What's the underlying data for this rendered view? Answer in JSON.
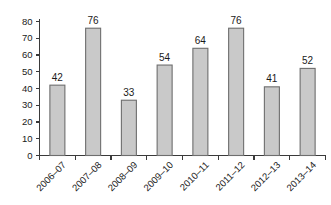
{
  "chart_data": {
    "type": "bar",
    "title": "",
    "subtitle": "",
    "xlabel": "",
    "ylabel": "",
    "categories": [
      "2006–07",
      "2007–08",
      "2008–09",
      "2009–10",
      "2010–11",
      "2011–12",
      "2012–13",
      "2013–14"
    ],
    "values": [
      42,
      76,
      33,
      54,
      64,
      76,
      41,
      52
    ],
    "data_labels": [
      "42",
      "76",
      "33",
      "54",
      "64",
      "76",
      "41",
      "52"
    ],
    "ylim": [
      0,
      80
    ],
    "yticks": [
      0,
      10,
      20,
      30,
      40,
      50,
      60,
      70,
      80
    ],
    "ytick_labels": [
      "0",
      "10",
      "20",
      "30",
      "40",
      "50",
      "60",
      "70",
      "80"
    ],
    "grid": false,
    "legend": null,
    "legend_position": "none",
    "xtick_rotation": -45,
    "bar_fill_color": "#c9c9c9",
    "bar_border_color": "#6e6e6e",
    "axis_color": "#3a3a3a",
    "background_color": "#ffffff",
    "text_color": "#1a1a1a"
  }
}
